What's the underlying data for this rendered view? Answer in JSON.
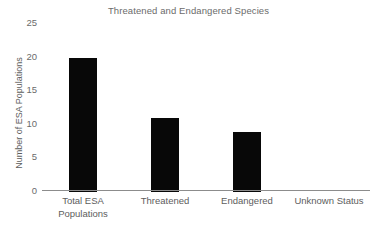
{
  "chart_data": {
    "type": "bar",
    "title": "Threatened and Endangered Species",
    "xlabel": "",
    "ylabel": "Number of ESA Populations",
    "categories": [
      "Total ESA\nPopulations",
      "Threatened",
      "Endangered",
      "Unknown Status"
    ],
    "values": [
      20,
      11,
      9,
      0
    ],
    "ylim": [
      0,
      25
    ],
    "yticks": [
      0,
      5,
      10,
      15,
      20,
      25
    ],
    "ytick_labels": [
      "0",
      "5",
      "10",
      "15",
      "20",
      "25"
    ],
    "grid": false,
    "legend": null,
    "bar_color": "#080808",
    "axis_color": "#8c8c8c",
    "title_color": "#6b6b6b",
    "label_color": "#5d5d5d"
  }
}
